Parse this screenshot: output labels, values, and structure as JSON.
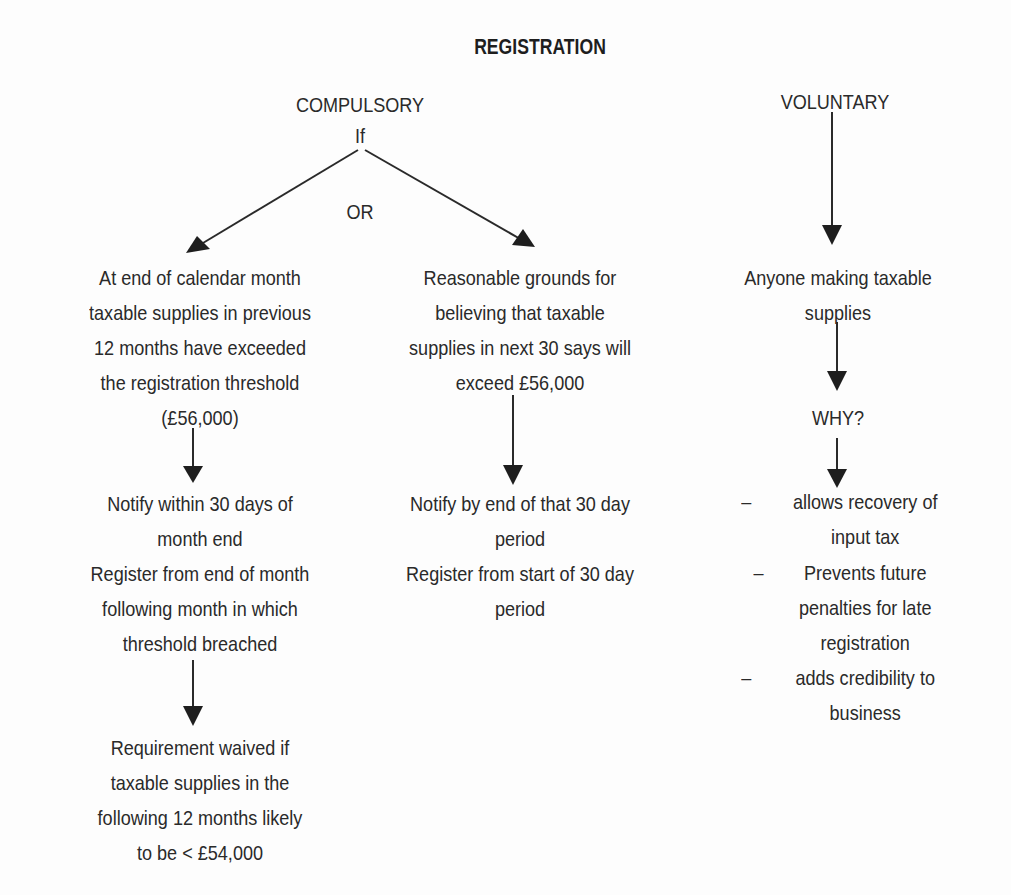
{
  "diagram": {
    "title": "REGISTRATION",
    "compulsory": {
      "heading": "COMPULSORY",
      "condition": "If",
      "branch_connector": "OR",
      "left_branch": {
        "condition_lines": [
          "At end of calendar month",
          "taxable supplies in previous",
          "12 months have exceeded",
          "the registration threshold",
          "(£56,000)"
        ],
        "action_lines": [
          "Notify within 30 days of",
          "month end",
          "Register from end of month",
          "following month in which",
          "threshold breached"
        ],
        "exception_lines": [
          "Requirement waived if",
          "taxable supplies in the",
          "following 12 months likely",
          "to be < £54,000"
        ]
      },
      "right_branch": {
        "condition_lines": [
          "Reasonable grounds for",
          "believing that taxable",
          "supplies in next 30 says will",
          "exceed £56,000"
        ],
        "action_lines": [
          "Notify by end of that 30 day",
          "period",
          "Register from start of 30 day",
          "period"
        ]
      }
    },
    "voluntary": {
      "heading": "VOLUNTARY",
      "who_lines": [
        "Anyone making taxable",
        "supplies"
      ],
      "why_label": "WHY?",
      "bullet_symbol": "–",
      "reasons": [
        {
          "lines": [
            "allows recovery of",
            "input tax"
          ]
        },
        {
          "lines": [
            "Prevents future",
            "penalties for late",
            "registration"
          ]
        },
        {
          "lines": [
            "adds credibility to",
            "business"
          ]
        }
      ]
    },
    "colors": {
      "background": "#fdfdfd",
      "ink": "#2a2a2a"
    }
  }
}
